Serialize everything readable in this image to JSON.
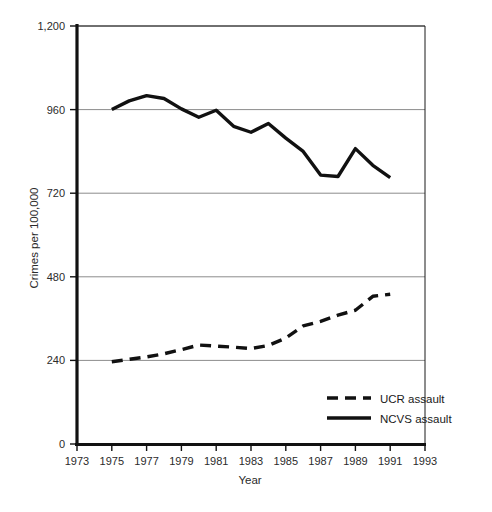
{
  "chart_data": {
    "type": "line",
    "title": "",
    "xlabel": "Year",
    "ylabel": "Crimes per 100,000",
    "xlim": [
      1973,
      1993
    ],
    "ylim": [
      0,
      1200
    ],
    "grid": true,
    "legend_position": "inside-bottom-right",
    "x_ticks": [
      "1973",
      "1975",
      "1977",
      "1979",
      "1981",
      "1983",
      "1985",
      "1987",
      "1989",
      "1991",
      "1993"
    ],
    "y_ticks": [
      "0",
      "240",
      "480",
      "720",
      "960",
      "1,200"
    ],
    "y_tick_values": [
      0,
      240,
      480,
      720,
      960,
      1200
    ],
    "x": [
      1975,
      1976,
      1977,
      1978,
      1979,
      1980,
      1981,
      1982,
      1983,
      1984,
      1985,
      1986,
      1987,
      1988,
      1989,
      1990,
      1991
    ],
    "series": [
      {
        "name": "UCR assault",
        "style": "dashed",
        "color": "#111111",
        "values": [
          236,
          243,
          250,
          259,
          271,
          284,
          281,
          278,
          274,
          283,
          304,
          339,
          352,
          370,
          384,
          424,
          430
        ]
      },
      {
        "name": "NCVS assault",
        "style": "solid",
        "color": "#111111",
        "values": [
          960,
          985,
          1000,
          992,
          962,
          938,
          958,
          912,
          895,
          920,
          878,
          840,
          772,
          768,
          848,
          800,
          765
        ]
      }
    ]
  },
  "legend": {
    "items": [
      {
        "label": "UCR assault",
        "style": "dashed"
      },
      {
        "label": "NCVS assault",
        "style": "solid"
      }
    ]
  },
  "axes": {
    "y_title": "Crimes per 100,000",
    "x_title": "Year"
  }
}
